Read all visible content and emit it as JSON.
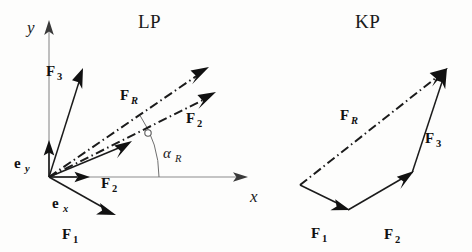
{
  "figure": {
    "caption_absent": true,
    "width": 472,
    "height": 252,
    "background": "#fdfdfc",
    "ink_color": "#111111",
    "axis_color": "#8c8c8c"
  },
  "panels": [
    {
      "id": "lp",
      "title": "LP",
      "title_pos": [
        138,
        28
      ],
      "description_kind": "position-plan",
      "origin": [
        49,
        177
      ],
      "axes": [
        {
          "name": "y-axis",
          "label": "y",
          "label_pos": [
            27,
            33
          ],
          "from": [
            49,
            177
          ],
          "to": [
            49,
            26
          ]
        },
        {
          "name": "x-axis",
          "label": "x",
          "label_pos": [
            250,
            202
          ],
          "from": [
            49,
            177
          ],
          "to": [
            243,
            177
          ]
        }
      ],
      "unit_vectors": [
        {
          "name": "e_y",
          "base": "e",
          "sub": "y",
          "label_pos": [
            14,
            168
          ],
          "from": [
            49,
            177
          ],
          "to": [
            49,
            142
          ]
        },
        {
          "name": "e_x",
          "base": "e",
          "sub": "x",
          "label_pos": [
            52,
            208
          ],
          "from": [
            49,
            177
          ],
          "to": [
            88,
            177
          ]
        }
      ],
      "forces": [
        {
          "name": "F_3",
          "base": "F",
          "sub": "3",
          "style": "solid",
          "label_pos": [
            46,
            76
          ],
          "from": [
            49,
            177
          ],
          "to": [
            82,
            72
          ]
        },
        {
          "name": "F_1",
          "base": "F",
          "sub": "1",
          "style": "solid",
          "label_pos": [
            62,
            239
          ],
          "from": [
            49,
            177
          ],
          "to": [
            112,
            213
          ]
        },
        {
          "name": "F_2",
          "base": "F",
          "sub": "2",
          "style": "solid",
          "label_pos": [
            101,
            188
          ],
          "from": [
            49,
            177
          ],
          "to": [
            129,
            142
          ]
        },
        {
          "name": "F_R",
          "base": "F",
          "sub": "R",
          "style": "dash-dot",
          "label_pos": [
            120,
            100
          ],
          "from": [
            49,
            177
          ],
          "to": [
            207,
            69
          ]
        },
        {
          "name": "F_2_resolved",
          "base": "F",
          "sub": "2",
          "style": "dash-dot",
          "label_pos": [
            186,
            123
          ],
          "from": [
            49,
            177
          ],
          "to": [
            214,
            94
          ]
        }
      ],
      "angle": {
        "name": "alpha_R",
        "base": "α",
        "sub": "R",
        "label_pos": [
          163,
          158
        ],
        "arc_center": [
          49,
          177
        ],
        "arc_radius": 110,
        "from_deg": 0,
        "to_deg": 34
      },
      "marker": {
        "name": "intersection-dot",
        "pos": [
          148,
          133
        ],
        "radius": 3.2
      }
    },
    {
      "id": "kp",
      "title": "KP",
      "title_pos": [
        355,
        28
      ],
      "description_kind": "force-polygon",
      "start": [
        300,
        185
      ],
      "forces": [
        {
          "name": "F_1",
          "base": "F",
          "sub": "1",
          "style": "solid",
          "label_pos": [
            311,
            238
          ],
          "from": [
            300,
            185
          ],
          "to": [
            347,
            208
          ]
        },
        {
          "name": "F_2",
          "base": "F",
          "sub": "2",
          "style": "solid",
          "label_pos": [
            384,
            239
          ],
          "from": [
            347,
            208
          ],
          "to": [
            411,
            172
          ]
        },
        {
          "name": "F_3",
          "base": "F",
          "sub": "3",
          "style": "solid",
          "label_pos": [
            425,
            143
          ],
          "from": [
            411,
            172
          ],
          "to": [
            446,
            70
          ]
        },
        {
          "name": "F_R",
          "base": "F",
          "sub": "R",
          "style": "dash-dot",
          "label_pos": [
            340,
            120
          ],
          "from": [
            300,
            185
          ],
          "to": [
            446,
            70
          ]
        }
      ]
    }
  ]
}
